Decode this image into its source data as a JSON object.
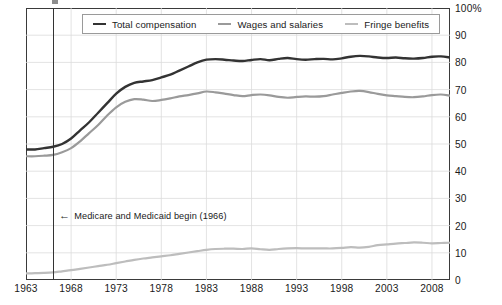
{
  "chart_data": {
    "type": "line",
    "title": "",
    "subtitle": "",
    "xlabel": "",
    "ylabel": "",
    "xlim": [
      1963,
      2010
    ],
    "ylim": [
      0,
      100
    ],
    "grid": true,
    "legend_position": "top-center",
    "x_tick_labels": [
      "1963",
      "1968",
      "1973",
      "1978",
      "1983",
      "1988",
      "1993",
      "1998",
      "2003",
      "2008"
    ],
    "x_tick_values": [
      1963,
      1968,
      1973,
      1978,
      1983,
      1988,
      1993,
      1998,
      2003,
      2008
    ],
    "y_tick_labels": [
      "100%",
      "90",
      "80",
      "70",
      "60",
      "50",
      "40",
      "30",
      "20",
      "10",
      "0"
    ],
    "y_tick_values": [
      100,
      90,
      80,
      70,
      60,
      50,
      40,
      30,
      20,
      10,
      0
    ],
    "x": [
      1963,
      1964,
      1965,
      1966,
      1967,
      1968,
      1969,
      1970,
      1971,
      1972,
      1973,
      1974,
      1975,
      1976,
      1977,
      1978,
      1979,
      1980,
      1981,
      1982,
      1983,
      1984,
      1985,
      1986,
      1987,
      1988,
      1989,
      1990,
      1991,
      1992,
      1993,
      1994,
      1995,
      1996,
      1997,
      1998,
      1999,
      2000,
      2001,
      2002,
      2003,
      2004,
      2005,
      2006,
      2007,
      2008,
      2009,
      2010
    ],
    "series": [
      {
        "name": "Total compensation",
        "color": "#333333",
        "values": [
          48,
          48,
          48.5,
          49,
          50,
          52,
          55,
          58,
          61.5,
          65,
          68.5,
          71,
          72.5,
          73,
          73.5,
          74.5,
          75.5,
          77,
          78.5,
          80,
          81,
          81.2,
          81,
          80.7,
          80.5,
          80.9,
          81.2,
          80.8,
          81.3,
          81.6,
          81.2,
          81,
          81.2,
          81.3,
          81.1,
          81.5,
          82.1,
          82.4,
          82.2,
          81.8,
          81.6,
          81.8,
          81.5,
          81.4,
          81.6,
          82.1,
          82.2,
          81.8
        ]
      },
      {
        "name": "Wages and salaries",
        "color": "#9a9a9a",
        "values": [
          45.5,
          45.5,
          45.7,
          46,
          47,
          48.5,
          51,
          54,
          57,
          60.5,
          63.5,
          65.5,
          66.5,
          66.3,
          65.8,
          66.2,
          66.8,
          67.5,
          68,
          68.6,
          69.3,
          69,
          68.5,
          68,
          67.6,
          68,
          68.2,
          67.9,
          67.3,
          67,
          67.3,
          67.5,
          67.4,
          67.6,
          68.2,
          68.8,
          69.3,
          69.5,
          69.1,
          68.4,
          67.9,
          67.6,
          67.3,
          67.2,
          67.5,
          68,
          68.2,
          67.8
        ]
      },
      {
        "name": "Fringe benefits",
        "color": "#bdbdbd",
        "values": [
          2.4,
          2.5,
          2.6,
          2.8,
          3.2,
          3.6,
          4.1,
          4.6,
          5.1,
          5.6,
          6.2,
          6.8,
          7.4,
          7.9,
          8.3,
          8.7,
          9.1,
          9.6,
          10.1,
          10.6,
          11.1,
          11.4,
          11.5,
          11.5,
          11.4,
          11.6,
          11.3,
          11.1,
          11.4,
          11.6,
          11.7,
          11.6,
          11.6,
          11.6,
          11.6,
          11.8,
          12.1,
          11.9,
          12.2,
          12.8,
          13.1,
          13.4,
          13.6,
          13.8,
          13.7,
          13.5,
          13.6,
          13.7
        ]
      }
    ],
    "annotations": [
      {
        "id": "medicare-medicaid-marker",
        "label": "Medicare and Medicaid begin (1966)",
        "arrow_glyph": "←",
        "x_value": 1966,
        "marker_type": "vertical-line",
        "marker_color": "#333333"
      }
    ]
  }
}
